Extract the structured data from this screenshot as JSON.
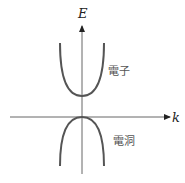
{
  "diagram": {
    "axes": {
      "y_label": "E",
      "x_label": "k"
    },
    "bands": [
      {
        "name": "electron",
        "label": "電子",
        "shape": "upward parabola"
      },
      {
        "name": "hole",
        "label": "電洞",
        "shape": "downward parabola"
      }
    ],
    "colors": {
      "axis": "#555555",
      "curve": "#555555",
      "text": "#222222"
    }
  }
}
